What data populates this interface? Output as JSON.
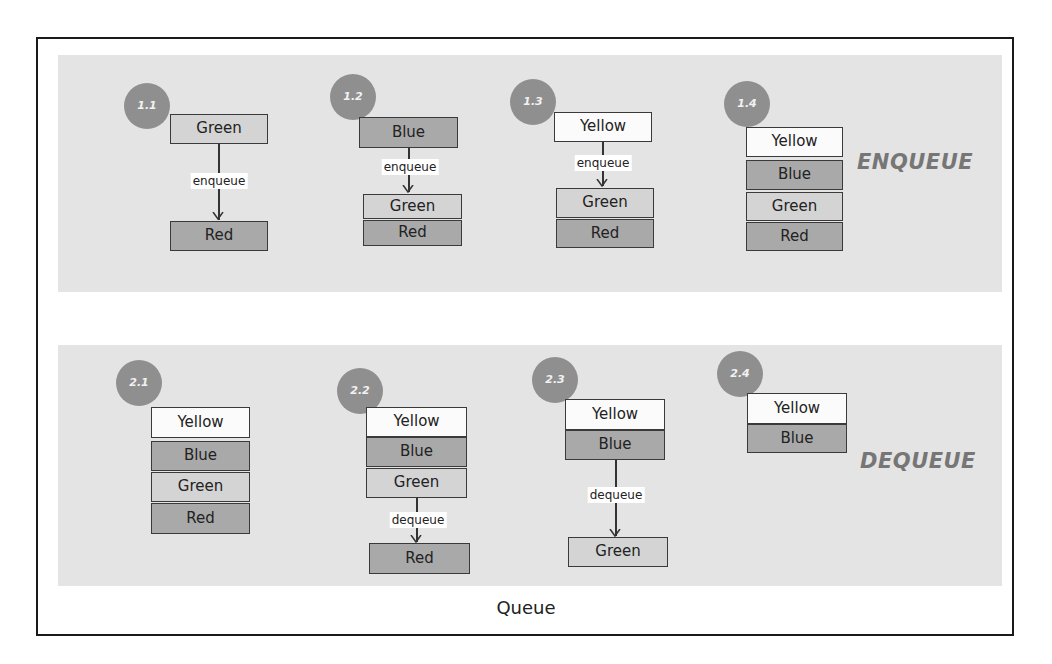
{
  "caption": "Queue",
  "colors": {
    "panel_bg": "#e4e4e4",
    "badge_bg": "#8f8f8f",
    "yellow_box": "#fbfbfb",
    "green_box": "#d4d4d4",
    "blue_box": "#a9a9a9",
    "red_box": "#a9a9a9",
    "section_title": "#767676"
  },
  "sections": {
    "enqueue": {
      "title": "ENQUEUE",
      "steps": [
        {
          "id": "1.1",
          "incoming": "Green",
          "op": "enqueue",
          "queue": [
            "Red"
          ]
        },
        {
          "id": "1.2",
          "incoming": "Blue",
          "op": "enqueue",
          "queue": [
            "Green",
            "Red"
          ]
        },
        {
          "id": "1.3",
          "incoming": "Yellow",
          "op": "enqueue",
          "queue": [
            "Green",
            "Red"
          ]
        },
        {
          "id": "1.4",
          "queue": [
            "Yellow",
            "Blue",
            "Green",
            "Red"
          ]
        }
      ]
    },
    "dequeue": {
      "title": "DEQUEUE",
      "steps": [
        {
          "id": "2.1",
          "queue": [
            "Yellow",
            "Blue",
            "Green",
            "Red"
          ]
        },
        {
          "id": "2.2",
          "queue": [
            "Yellow",
            "Blue",
            "Green"
          ],
          "op": "dequeue",
          "outgoing": "Red"
        },
        {
          "id": "2.3",
          "queue": [
            "Yellow",
            "Blue"
          ],
          "op": "dequeue",
          "outgoing": "Green"
        },
        {
          "id": "2.4",
          "queue": [
            "Yellow",
            "Blue"
          ]
        }
      ]
    }
  }
}
